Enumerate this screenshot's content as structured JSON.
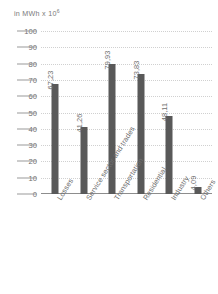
{
  "chart_data": {
    "type": "bar",
    "title": "",
    "subtitle": "",
    "xlabel": "",
    "ylabel": "in MWh x 10",
    "ylabel_exponent": "6",
    "ylim": [
      0,
      100
    ],
    "ytick_step": 10,
    "yticks": [
      "100",
      "90",
      "80",
      "70",
      "60",
      "50",
      "40",
      "30",
      "20",
      "10",
      "0"
    ],
    "grid": true,
    "legend": "none",
    "decimal_separator": ",",
    "bar_color": "#595959",
    "categories": [
      "Losses",
      "Service sector and trades",
      "Transportation",
      "Residential",
      "Industry",
      "Others"
    ],
    "values": [
      67.23,
      41.26,
      79.93,
      73.83,
      48.11,
      4.09
    ],
    "value_labels": [
      "67,23",
      "41,26",
      "79,93",
      "73,83",
      "48,11",
      "4,09"
    ]
  }
}
